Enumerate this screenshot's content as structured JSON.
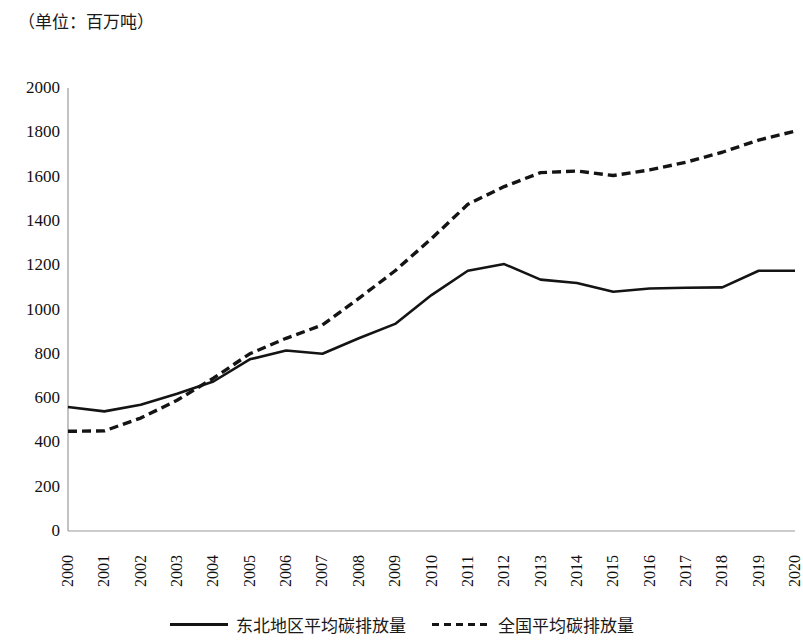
{
  "figure": {
    "unit_note": "（单位：百万吨）"
  },
  "legend": {
    "position": "bottom",
    "entries": [
      {
        "label": "东北地区平均碳排放量",
        "style": "solid",
        "swatch": "solid-line-swatch"
      },
      {
        "label": "全国平均碳排放量",
        "style": "dashed",
        "swatch": "dashed-line-swatch"
      }
    ]
  },
  "axes": {
    "y_ticks": [
      "2000",
      "1800",
      "1600",
      "1400",
      "1200",
      "1000",
      "800",
      "600",
      "400",
      "200",
      "0"
    ],
    "x_ticks": [
      "2000",
      "2001",
      "2002",
      "2003",
      "2004",
      "2005",
      "2006",
      "2007",
      "2008",
      "2009",
      "2010",
      "2011",
      "2012",
      "2013",
      "2014",
      "2015",
      "2016",
      "2017",
      "2018",
      "2019",
      "2020"
    ]
  },
  "chart_data": {
    "type": "line",
    "title": "（单位：百万吨）",
    "subtitle": "",
    "xlabel": "",
    "ylabel": "",
    "unit": "百万吨",
    "x": [
      2000,
      2001,
      2002,
      2003,
      2004,
      2005,
      2006,
      2007,
      2008,
      2009,
      2010,
      2011,
      2012,
      2013,
      2014,
      2015,
      2016,
      2017,
      2018,
      2019,
      2020
    ],
    "categories": [
      "2000",
      "2001",
      "2002",
      "2003",
      "2004",
      "2005",
      "2006",
      "2007",
      "2008",
      "2009",
      "2010",
      "2011",
      "2012",
      "2013",
      "2014",
      "2015",
      "2016",
      "2017",
      "2018",
      "2019",
      "2020"
    ],
    "series": [
      {
        "name": "东北地区平均碳排放量",
        "style": "solid",
        "color": "#141414",
        "values": [
          560,
          540,
          570,
          620,
          675,
          775,
          815,
          800,
          870,
          935,
          1065,
          1175,
          1205,
          1135,
          1120,
          1080,
          1095,
          1098,
          1100,
          1175,
          1175
        ]
      },
      {
        "name": "全国平均碳排放量",
        "style": "dashed",
        "color": "#141414",
        "values": [
          450,
          452,
          510,
          590,
          690,
          800,
          870,
          930,
          1050,
          1175,
          1320,
          1475,
          1555,
          1618,
          1625,
          1605,
          1630,
          1665,
          1710,
          1765,
          1805
        ]
      }
    ],
    "ylim": [
      0,
      2000
    ],
    "ytick_step": 200,
    "xlim": [
      2000,
      2020
    ],
    "grid": false,
    "legend_position": "bottom"
  }
}
